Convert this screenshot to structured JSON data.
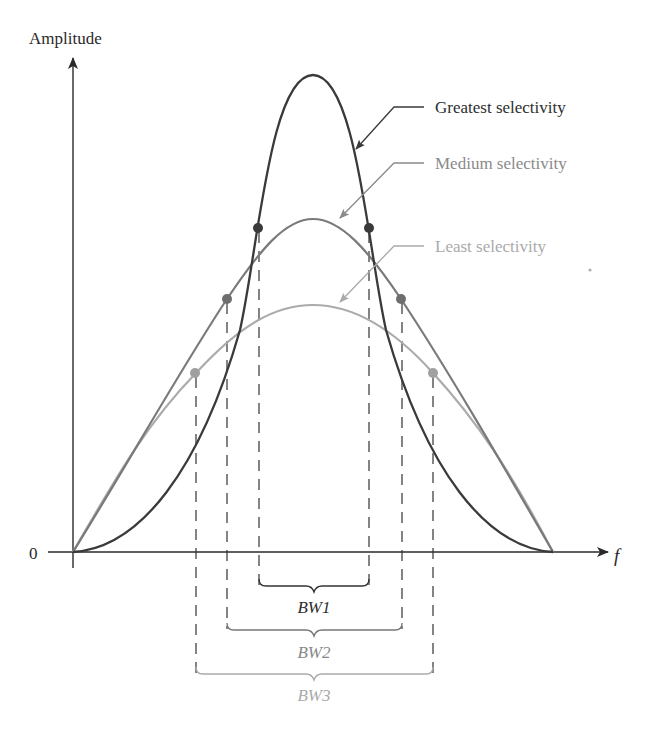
{
  "figure": {
    "y_axis_label": "Amplitude",
    "x_axis_label": "f",
    "origin_label": "0"
  },
  "colors": {
    "greatest": "#3a3a3a",
    "medium": "#7a7a7a",
    "least": "#ababab",
    "axis": "#2a2a2a",
    "greatest_text": "#2e2e2e",
    "medium_text": "#8a8a8a",
    "least_text": "#aaaaaa"
  },
  "curves": [
    {
      "name": "Greatest selectivity",
      "key": "greatest",
      "peak_y": 75,
      "dot_y": 228,
      "dot_x": [
        258,
        369
      ],
      "bw_label": "BW1",
      "bracket_y": 588
    },
    {
      "name": "Medium selectivity",
      "key": "medium",
      "peak_y": 219,
      "dot_y": 299,
      "dot_x": [
        227,
        401
      ],
      "bw_label": "BW2",
      "bracket_y": 631
    },
    {
      "name": "Least selectivity",
      "key": "least",
      "peak_y": 305,
      "dot_y": 373,
      "dot_x": [
        195,
        433
      ],
      "bw_label": "BW3",
      "bracket_y": 675
    }
  ],
  "labels": {
    "greatest": "Greatest selectivity",
    "medium": "Medium selectivity",
    "least": "Least selectivity",
    "bw1": "BW1",
    "bw2": "BW2",
    "bw3": "BW3"
  }
}
